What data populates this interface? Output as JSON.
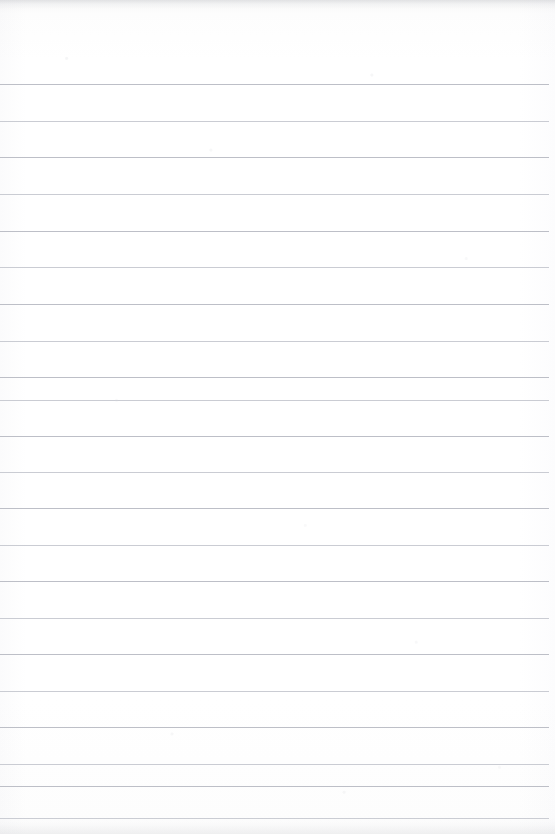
{
  "document": {
    "kind": "ruled-notebook-page",
    "title": "",
    "body_text": "",
    "page_width": 555,
    "page_height": 834,
    "background_color": "#fefefe",
    "is_blank": true
  },
  "header_zone": {
    "label": "",
    "height": 84
  },
  "ruling": {
    "line_color": "#b9bcc4",
    "line_color_soft": "#c4c7ce",
    "line_thickness": 1,
    "line_spacing": 36.6,
    "first_line_y": 84,
    "left_inset": 0,
    "right_extent": 549,
    "line_count": 21,
    "lines": [
      {
        "index": 1,
        "y": 84,
        "x1": 0,
        "x2": 549,
        "tone": "normal"
      },
      {
        "index": 2,
        "y": 121,
        "x1": 0,
        "x2": 549,
        "tone": "soft"
      },
      {
        "index": 3,
        "y": 157,
        "x1": 0,
        "x2": 549,
        "tone": "normal"
      },
      {
        "index": 4,
        "y": 194,
        "x1": 0,
        "x2": 549,
        "tone": "soft"
      },
      {
        "index": 5,
        "y": 231,
        "x1": 0,
        "x2": 549,
        "tone": "normal"
      },
      {
        "index": 6,
        "y": 267,
        "x1": 0,
        "x2": 549,
        "tone": "soft"
      },
      {
        "index": 7,
        "y": 304,
        "x1": 0,
        "x2": 549,
        "tone": "normal"
      },
      {
        "index": 8,
        "y": 341,
        "x1": 0,
        "x2": 549,
        "tone": "soft"
      },
      {
        "index": 9,
        "y": 377,
        "x1": 0,
        "x2": 549,
        "tone": "normal"
      },
      {
        "index": 10,
        "y": 400,
        "x1": 0,
        "x2": 549,
        "tone": "soft"
      },
      {
        "index": 11,
        "y": 436,
        "x1": 0,
        "x2": 549,
        "tone": "normal"
      },
      {
        "index": 12,
        "y": 472,
        "x1": 0,
        "x2": 549,
        "tone": "soft"
      },
      {
        "index": 13,
        "y": 508,
        "x1": 0,
        "x2": 549,
        "tone": "normal"
      },
      {
        "index": 14,
        "y": 545,
        "x1": 0,
        "x2": 549,
        "tone": "soft"
      },
      {
        "index": 15,
        "y": 581,
        "x1": 0,
        "x2": 549,
        "tone": "normal"
      },
      {
        "index": 16,
        "y": 618,
        "x1": 0,
        "x2": 549,
        "tone": "soft"
      },
      {
        "index": 17,
        "y": 654,
        "x1": 0,
        "x2": 549,
        "tone": "normal"
      },
      {
        "index": 18,
        "y": 691,
        "x1": 0,
        "x2": 549,
        "tone": "soft"
      },
      {
        "index": 19,
        "y": 727,
        "x1": 0,
        "x2": 549,
        "tone": "normal"
      },
      {
        "index": 20,
        "y": 764,
        "x1": 0,
        "x2": 549,
        "tone": "soft"
      },
      {
        "index": 21,
        "y": 786,
        "x1": 0,
        "x2": 549,
        "tone": "normal"
      },
      {
        "index": 22,
        "y": 818,
        "x1": 0,
        "x2": 549,
        "tone": "soft"
      }
    ]
  },
  "scan_artifacts": {
    "top_edge_shadow": true,
    "bottom_edge_speckle": true,
    "grain": true
  }
}
